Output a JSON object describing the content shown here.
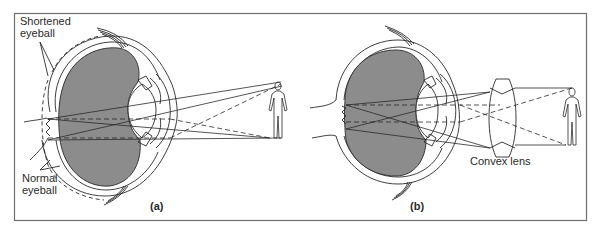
{
  "figure": {
    "frame": {
      "x": 14,
      "y": 13,
      "width": 572,
      "height": 207,
      "border_color": "#6e6e6e"
    },
    "colors": {
      "vitreous_fill": "#8c8c8c",
      "line": "#2a2a2a",
      "background": "#ffffff"
    },
    "panels": [
      {
        "id": "a",
        "caption": "(a)",
        "labels": {
          "shortened": [
            "Shortened",
            "eyeball"
          ],
          "normal": [
            "Normal",
            "eyeball"
          ]
        }
      },
      {
        "id": "b",
        "caption": "(b)",
        "labels": {
          "lens": "Convex lens"
        }
      }
    ]
  }
}
